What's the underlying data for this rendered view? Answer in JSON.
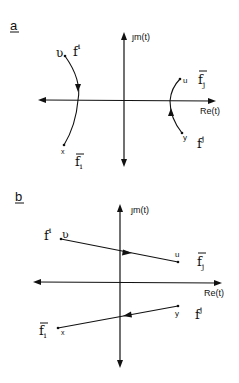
{
  "panels": [
    {
      "id": "a",
      "label": "a",
      "axis_labels": {
        "imag": "ȷm(t)",
        "real": "Re(t)"
      },
      "points": {
        "left_top": "ʋ",
        "left_bottom": "x",
        "right_top": "u",
        "right_bottom": "y"
      },
      "curve_labels": {
        "left_top": "f",
        "left_top_sup": "i",
        "left_bottom": "f",
        "left_bottom_sub": "i",
        "right_top": "f",
        "right_top_sub": "j",
        "right_bottom": "f",
        "right_bottom_sup": "j"
      }
    },
    {
      "id": "b",
      "label": "b",
      "axis_labels": {
        "imag": "ȷm(t)",
        "real": "Re(t)"
      },
      "points": {
        "left_top": "ʋ",
        "left_bottom": "x",
        "right_top": "u",
        "right_bottom": "y"
      },
      "curve_labels": {
        "left_top": "f",
        "left_top_sup": "i",
        "left_bottom": "f",
        "left_bottom_sub": "i",
        "right_top": "f",
        "right_top_sub": "j",
        "right_bottom": "f",
        "right_bottom_sup": "j"
      }
    }
  ],
  "colors": {
    "ink": "#111111",
    "background": "#ffffff"
  }
}
